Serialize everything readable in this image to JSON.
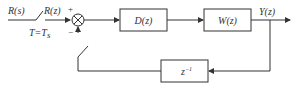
{
  "diagram": {
    "type": "block-diagram",
    "input_label": "R(s)",
    "sampled_label": "R(z)",
    "sampler_label": "T=T",
    "sampler_sub": "s",
    "sum_plus": "+",
    "sum_minus": "−",
    "blocks": [
      {
        "id": "controller",
        "label": "D(z)"
      },
      {
        "id": "plant",
        "label": "W(z)"
      },
      {
        "id": "delay",
        "label": "z",
        "sup": "−1"
      }
    ],
    "output_label": "Y(z)",
    "colors": {
      "line": "#333333",
      "background": "#ffffff"
    }
  }
}
